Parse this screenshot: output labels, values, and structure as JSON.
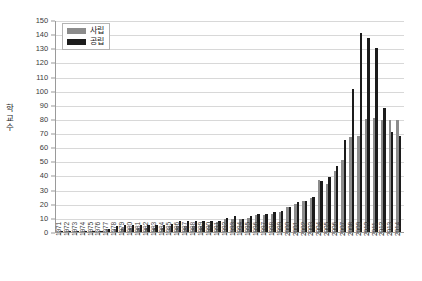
{
  "chart_data": {
    "type": "bar",
    "title": "",
    "subtitle": "",
    "xlabel": "",
    "ylabel": "학교수",
    "ylim": [
      0,
      150
    ],
    "ytick_step": 10,
    "yticks": [
      150,
      140,
      130,
      120,
      110,
      100,
      90,
      80,
      70,
      60,
      50,
      40,
      30,
      20,
      10,
      0
    ],
    "grid": "horizontal",
    "legend_position": "top-left",
    "colors": {
      "private": "#8c8c8c",
      "public": "#1c1c1c",
      "gridline": "#d8d8d8",
      "axis": "#9a9a9a",
      "background": "#ffffff"
    },
    "categories": [
      "1971",
      "1972",
      "1973",
      "1974",
      "1975",
      "1976",
      "1977",
      "1978",
      "1979",
      "1980",
      "1981",
      "1982",
      "1983",
      "1984",
      "1985",
      "1986",
      "1987",
      "1988",
      "1989",
      "1990",
      "1991",
      "1992",
      "1993",
      "1994",
      "1995",
      "1996",
      "1997",
      "1998",
      "1999",
      "2000",
      "2001",
      "2002",
      "2003",
      "2004",
      "2005",
      "2006",
      "2007",
      "2008",
      "2009",
      "2010",
      "2011",
      "2012",
      "2013",
      "2014"
    ],
    "series": [
      {
        "name": "사립",
        "color": "#8c8c8c",
        "values": [
          1,
          1,
          1,
          1,
          1,
          1,
          2,
          2,
          3,
          3,
          3,
          3,
          3,
          3,
          4,
          4,
          4,
          4,
          4,
          5,
          7,
          9,
          9,
          9,
          10,
          12,
          12,
          13,
          14,
          18,
          20,
          22,
          24,
          37,
          34,
          43,
          51,
          67,
          68,
          80,
          81,
          79,
          79,
          79
        ]
      },
      {
        "name": "공립",
        "color": "#1c1c1c",
        "values": [
          1,
          1,
          1,
          1,
          1,
          1,
          2,
          4,
          5,
          5,
          5,
          5,
          5,
          5,
          6,
          8,
          8,
          8,
          8,
          8,
          8,
          10,
          11,
          9,
          11,
          13,
          13,
          14,
          15,
          18,
          21,
          22,
          25,
          36,
          39,
          47,
          65,
          101,
          141,
          137,
          130,
          88,
          71,
          68
        ]
      }
    ]
  },
  "legend": {
    "items": [
      {
        "label": "사립",
        "swatch": "legend-swatch-private"
      },
      {
        "label": "공립",
        "swatch": "legend-swatch-public"
      }
    ]
  },
  "axes": {
    "y_title": "학교수"
  }
}
